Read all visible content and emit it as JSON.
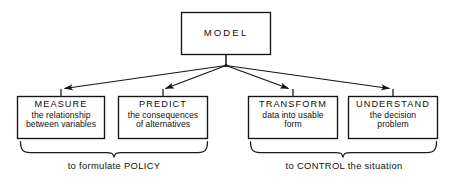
{
  "diagram": {
    "title": "MODEL",
    "root": {
      "label": "MODEL",
      "name": "model-root-box"
    },
    "nodes": [
      {
        "id": "measure",
        "title": "MEASURE",
        "lines": [
          "the relationship",
          "between variables"
        ],
        "group": "policy"
      },
      {
        "id": "predict",
        "title": "PREDICT",
        "lines": [
          "the consequences",
          "of alternatives"
        ],
        "group": "policy"
      },
      {
        "id": "transform",
        "title": "TRANSFORM",
        "lines": [
          "data into usable",
          "form"
        ],
        "group": "control"
      },
      {
        "id": "understand",
        "title": "UNDERSTAND",
        "lines": [
          "the decision",
          "problem"
        ],
        "group": "control"
      }
    ],
    "groups": [
      {
        "id": "policy",
        "caption": "to formulate POLICY"
      },
      {
        "id": "control",
        "caption": "to CONTROL the situation"
      }
    ],
    "colors": {
      "background": "#ffffff",
      "ink": "#1a1a1a",
      "box_stroke": "#141414"
    }
  }
}
